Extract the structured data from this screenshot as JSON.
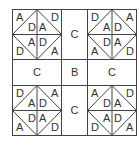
{
  "diagram": {
    "middle_labels": {
      "top": "C",
      "left": "C",
      "center": "B",
      "right": "C",
      "bottom": "C"
    },
    "quadrants": [
      {
        "id": "top-left",
        "corners": [
          "A",
          "D",
          "D",
          "A"
        ],
        "inner": [
          "D",
          "A",
          "A",
          "D"
        ]
      },
      {
        "id": "top-right",
        "corners": [
          "D",
          "A",
          "A",
          "D"
        ],
        "inner": [
          "A",
          "D",
          "D",
          "A"
        ]
      },
      {
        "id": "bottom-left",
        "corners": [
          "D",
          "A",
          "A",
          "D"
        ],
        "inner": [
          "A",
          "D",
          "D",
          "A"
        ]
      },
      {
        "id": "bottom-right",
        "corners": [
          "A",
          "D",
          "D",
          "A"
        ],
        "inner": [
          "D",
          "A",
          "A",
          "D"
        ]
      }
    ],
    "colors": {
      "line": "#444444",
      "text": "#333333",
      "background": "#ffffff"
    }
  }
}
